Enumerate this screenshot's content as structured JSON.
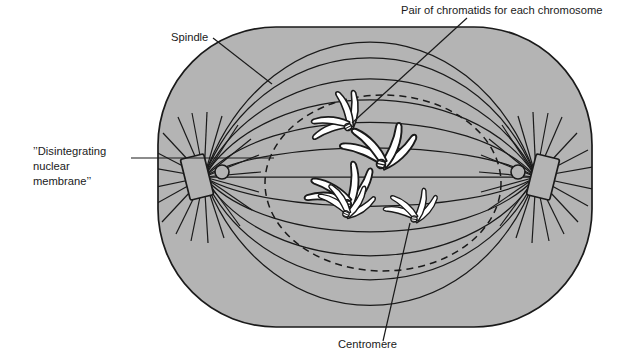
{
  "figure": {
    "title_alt": "Mitosis metaphase cell diagram",
    "colors": {
      "cytoplasm_fill": "#b4b4b4",
      "outline": "#1a1a1a",
      "chromosome_fill": "#ffffff",
      "background": "#ffffff",
      "label_text": "#1a1a1a"
    }
  },
  "labels": {
    "spindle": {
      "text": "Spindle",
      "x": 171,
      "y": 41,
      "anchor": "start"
    },
    "chromatids": {
      "text": "Pair of chromatids for each chromosome",
      "x": 401,
      "y": 14,
      "anchor": "start"
    },
    "nuclear_membrane": {
      "line1": "’’Disintegrating",
      "line2": "nuclear",
      "line3": "membrane’’",
      "x": 33,
      "y": 155,
      "anchor": "start"
    },
    "centromere": {
      "text": "Centromere",
      "x": 338,
      "y": 348,
      "anchor": "start"
    }
  },
  "cell": {
    "name": "cell-body",
    "left": 158,
    "top": 27,
    "right": 592,
    "bottom": 327,
    "corner_radius": 118
  },
  "nuclear_membrane_circle": {
    "cx": 383,
    "cy": 183,
    "rx": 118,
    "ry": 88,
    "dash": "7 5"
  },
  "poles": {
    "left": {
      "cx": 204,
      "cy": 177
    },
    "right": {
      "cx": 536,
      "cy": 177
    }
  },
  "spindle_fiber_count": 11,
  "chromosomes": [
    {
      "id": "chromosome-1",
      "cx": 348,
      "cy": 127,
      "rot": -28
    },
    {
      "id": "chromosome-2",
      "cx": 379,
      "cy": 163,
      "rot": 12
    },
    {
      "id": "chromosome-3",
      "cx": 348,
      "cy": 202,
      "rot": -4
    },
    {
      "id": "chromosome-4",
      "cx": 348,
      "cy": 213,
      "rot": 18
    },
    {
      "id": "chromosome-5",
      "cx": 414,
      "cy": 218,
      "rot": 6
    }
  ]
}
